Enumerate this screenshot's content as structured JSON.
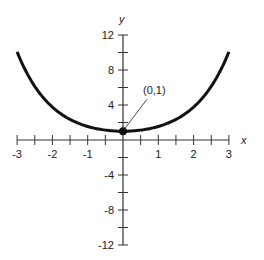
{
  "chart_data": {
    "type": "line",
    "title": "",
    "xlabel": "x",
    "ylabel": "y",
    "xlim": [
      -3,
      3
    ],
    "ylim": [
      -12,
      12
    ],
    "x_ticks": [
      -3,
      -2.5,
      -2,
      -1.5,
      -1,
      -0.5,
      0,
      0.5,
      1,
      1.5,
      2,
      2.5,
      3
    ],
    "x_tick_labels": [
      "-3",
      "-2",
      "-1",
      "1",
      "2",
      "3"
    ],
    "y_ticks": [
      -12,
      -10,
      -8,
      -6,
      -4,
      -2,
      2,
      4,
      6,
      8,
      10,
      12
    ],
    "y_tick_labels": [
      "12",
      "8",
      "4",
      "-4",
      "-8",
      "-12"
    ],
    "grid": false,
    "series": [
      {
        "name": "y = cosh(x)",
        "x": [
          -3,
          -2.5,
          -2,
          -1.5,
          -1,
          -0.5,
          0,
          0.5,
          1,
          1.5,
          2,
          2.5,
          3
        ],
        "values": [
          10.07,
          6.13,
          3.76,
          2.35,
          1.54,
          1.13,
          1,
          1.13,
          1.54,
          2.35,
          3.76,
          6.13,
          10.07
        ]
      }
    ],
    "annotations": [
      {
        "text": "(0,1)",
        "x": 0,
        "y": 1
      }
    ],
    "color": "#111111"
  }
}
